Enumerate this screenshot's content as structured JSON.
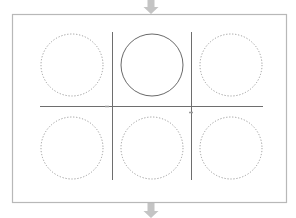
{
  "diagram": {
    "colors": {
      "frame": "#b8b8b8",
      "arrow": "#c4c4c4",
      "grid_line": "#6e6e6e",
      "solid_circle": "#6a6a6a",
      "dotted_circle": "#9a9a9a",
      "marker": "#9a9a9a"
    },
    "frame": {
      "x": 12,
      "y": 14,
      "width": 274,
      "height": 188
    },
    "arrows": [
      {
        "id": "in-arrow",
        "direction": "down",
        "x": 151,
        "y_top": 0,
        "y_tip": 14
      },
      {
        "id": "out-arrow",
        "direction": "down",
        "x": 151,
        "y_top": 203,
        "y_tip": 218
      }
    ],
    "grid_lines": {
      "horizontal": [
        {
          "y": 106,
          "x1": 40,
          "x2": 263
        }
      ],
      "vertical": [
        {
          "x": 112,
          "y1": 32,
          "y2": 180
        },
        {
          "x": 191,
          "y1": 32,
          "y2": 180
        }
      ]
    },
    "markers": [
      {
        "x": 107,
        "y": 106
      },
      {
        "x": 191,
        "y": 112
      }
    ],
    "circles": [
      {
        "id": "top-left",
        "row": 1,
        "col": 1,
        "cx": 72,
        "cy": 65,
        "r": 31,
        "style": "dotted"
      },
      {
        "id": "top-center",
        "row": 1,
        "col": 2,
        "cx": 152,
        "cy": 65,
        "r": 31,
        "style": "solid"
      },
      {
        "id": "top-right",
        "row": 1,
        "col": 3,
        "cx": 231,
        "cy": 65,
        "r": 31,
        "style": "dotted"
      },
      {
        "id": "bottom-left",
        "row": 2,
        "col": 1,
        "cx": 72,
        "cy": 148,
        "r": 31,
        "style": "dotted"
      },
      {
        "id": "bottom-center",
        "row": 2,
        "col": 2,
        "cx": 152,
        "cy": 148,
        "r": 31,
        "style": "dotted"
      },
      {
        "id": "bottom-right",
        "row": 2,
        "col": 3,
        "cx": 231,
        "cy": 148,
        "r": 31,
        "style": "dotted"
      }
    ]
  }
}
